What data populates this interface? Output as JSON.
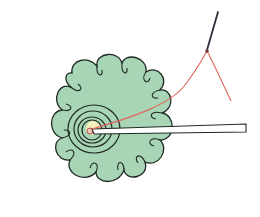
{
  "illustration": {
    "description": "Hand-drawn diagram of a scalloped green flower-shaped fabric with concentric stitching circles at the center, a white rod inserted from the right, and a needle with red thread",
    "colors": {
      "flower_fill": "#a8d5b5",
      "outline": "#1f2a24",
      "thread": "#e2655e",
      "needle": "#2b2f3a",
      "center_fill": "#f2efb8",
      "rod_fill": "#ffffff"
    },
    "elements": [
      "flower-fabric",
      "concentric-stitches",
      "center-knot",
      "rod",
      "needle",
      "thread"
    ]
  }
}
